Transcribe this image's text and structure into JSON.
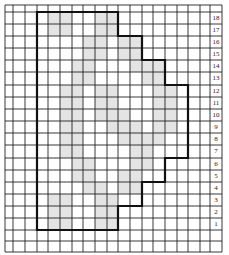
{
  "figure": {
    "grid": {
      "x_lines": [
        5,
        13,
        25,
        37,
        48,
        60,
        72,
        83,
        95,
        107,
        118,
        130,
        142,
        153,
        165,
        177,
        188,
        200,
        210,
        222
      ],
      "y_lines": [
        5,
        12,
        24,
        36,
        48,
        60,
        72,
        85,
        97,
        109,
        121,
        133,
        145,
        158,
        170,
        182,
        194,
        206,
        218,
        230,
        241,
        252
      ],
      "line_color": "#222222",
      "shade_color": "#e4e4e4"
    },
    "row_labels": [
      "18",
      "17",
      "16",
      "15",
      "14",
      "13",
      "12",
      "11",
      "10",
      "9",
      "8",
      "7",
      "6",
      "5",
      "4",
      "3",
      "2",
      "1"
    ],
    "outline_points": [
      [
        37,
        12
      ],
      [
        118,
        12
      ],
      [
        118,
        36
      ],
      [
        142,
        36
      ],
      [
        142,
        60
      ],
      [
        165,
        60
      ],
      [
        165,
        85
      ],
      [
        188,
        85
      ],
      [
        188,
        158
      ],
      [
        165,
        158
      ],
      [
        165,
        182
      ],
      [
        142,
        182
      ],
      [
        142,
        206
      ],
      [
        118,
        206
      ],
      [
        118,
        230
      ],
      [
        37,
        230
      ]
    ],
    "shade_rows": [
      [
        0,
        1,
        1,
        0,
        0,
        1,
        1,
        0,
        0,
        0,
        0,
        0,
        0
      ],
      [
        0,
        1,
        1,
        0,
        0,
        1,
        1,
        0,
        0,
        0,
        0,
        0,
        0
      ],
      [
        0,
        0,
        0,
        0,
        1,
        1,
        0,
        1,
        1,
        0,
        0,
        0,
        0
      ],
      [
        0,
        0,
        0,
        0,
        1,
        1,
        0,
        1,
        1,
        0,
        0,
        0,
        0
      ],
      [
        0,
        0,
        0,
        1,
        1,
        0,
        0,
        0,
        1,
        1,
        1,
        0,
        0
      ],
      [
        0,
        0,
        0,
        1,
        1,
        0,
        0,
        0,
        0,
        1,
        1,
        0,
        0
      ],
      [
        0,
        0,
        1,
        1,
        0,
        1,
        1,
        0,
        0,
        0,
        1,
        1,
        0
      ],
      [
        0,
        0,
        1,
        1,
        0,
        1,
        1,
        0,
        0,
        0,
        1,
        1,
        0
      ],
      [
        0,
        0,
        1,
        1,
        0,
        1,
        1,
        1,
        0,
        0,
        1,
        1,
        0
      ],
      [
        0,
        0,
        1,
        1,
        0,
        0,
        1,
        1,
        1,
        0,
        1,
        1,
        0
      ],
      [
        0,
        0,
        1,
        1,
        0,
        0,
        0,
        1,
        1,
        1,
        1,
        0,
        0
      ],
      [
        0,
        0,
        1,
        1,
        0,
        0,
        0,
        0,
        1,
        1,
        0,
        0,
        0
      ],
      [
        0,
        0,
        0,
        1,
        1,
        0,
        0,
        0,
        1,
        1,
        0,
        0,
        0
      ],
      [
        0,
        0,
        0,
        1,
        1,
        0,
        0,
        1,
        1,
        0,
        0,
        0,
        0
      ],
      [
        0,
        0,
        0,
        0,
        1,
        1,
        0,
        1,
        1,
        0,
        0,
        0,
        0
      ],
      [
        0,
        1,
        1,
        0,
        0,
        1,
        1,
        0,
        0,
        0,
        0,
        0,
        0
      ],
      [
        0,
        1,
        1,
        0,
        0,
        1,
        1,
        0,
        0,
        0,
        0,
        0,
        0
      ],
      [
        0,
        1,
        1,
        0,
        0,
        1,
        1,
        0,
        0,
        0,
        0,
        0,
        0
      ]
    ]
  }
}
